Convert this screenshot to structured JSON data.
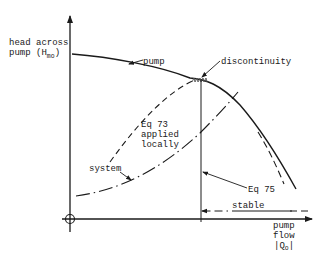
{
  "axes": {
    "y_label_line1": "head across",
    "y_label_line2_prefix": "pump  (H",
    "y_label_sub": "mo",
    "y_label_suffix": ")",
    "x_label_line1": "pump",
    "x_label_line2": "flow",
    "x_label_line3_prefix": "|Q",
    "x_label_sub": "o",
    "x_label_line3_suffix": "|"
  },
  "labels": {
    "pump": "pump",
    "discontinuity": "discontinuity",
    "eq73_line1": "Eq 73",
    "eq73_line2": "applied",
    "eq73_line3": "locally",
    "system": "system",
    "eq75": "Eq 75",
    "stable": "stable"
  },
  "colors": {
    "ink": "#1a1a1a",
    "background": "#ffffff"
  }
}
